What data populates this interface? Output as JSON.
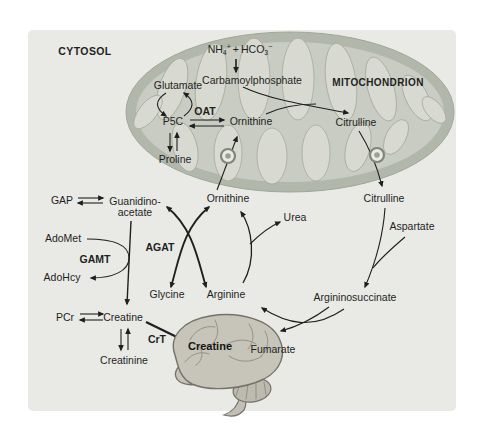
{
  "colors": {
    "panel_bg": "#e9eae5",
    "membrane": "#b2b7ab",
    "matrix": "#c9ccc2",
    "cristae": "#d8dad1",
    "brain": "#c7c4b9",
    "brain_dark": "#75726a",
    "arrow": "#1f1f1f"
  },
  "compartments": {
    "cytosol": "CYTOSOL",
    "mitochondrion": "MITOCHONDRION"
  },
  "enzymes": {
    "oat": "OAT",
    "agat": "AGAT",
    "gamt": "GAMT",
    "crt": "CrT"
  },
  "molecules": {
    "ammonia": {
      "nh": "NH",
      "nh_sub": "4",
      "nh_sup": "+",
      "plus": "+",
      "hco": "HCO",
      "hco_sub": "3",
      "hco_sup": "−"
    },
    "carbamoylphosphate": "Carbamoylphosphate",
    "glutamate": "Glutamate",
    "p5c": "P5C",
    "proline": "Proline",
    "ornithine_mito": "Ornithine",
    "citrulline_mito": "Citrulline",
    "ornithine_cytosol": "Ornithine",
    "citrulline_cytosol": "Citrulline",
    "urea": "Urea",
    "aspartate": "Aspartate",
    "argininosuccinate": "Argininosuccinate",
    "fumarate": "Fumarate",
    "arginine": "Arginine",
    "glycine": "Glycine",
    "gap": "GAP",
    "guanidinoacetate_line1": "Guanidino-",
    "guanidinoacetate_line2": "acetate",
    "adomet": "AdoMet",
    "adohcy": "AdoHcy",
    "pcr": "PCr",
    "creatine": "Creatine",
    "creatinine": "Creatinine",
    "creatine_brain": "Creatine"
  }
}
